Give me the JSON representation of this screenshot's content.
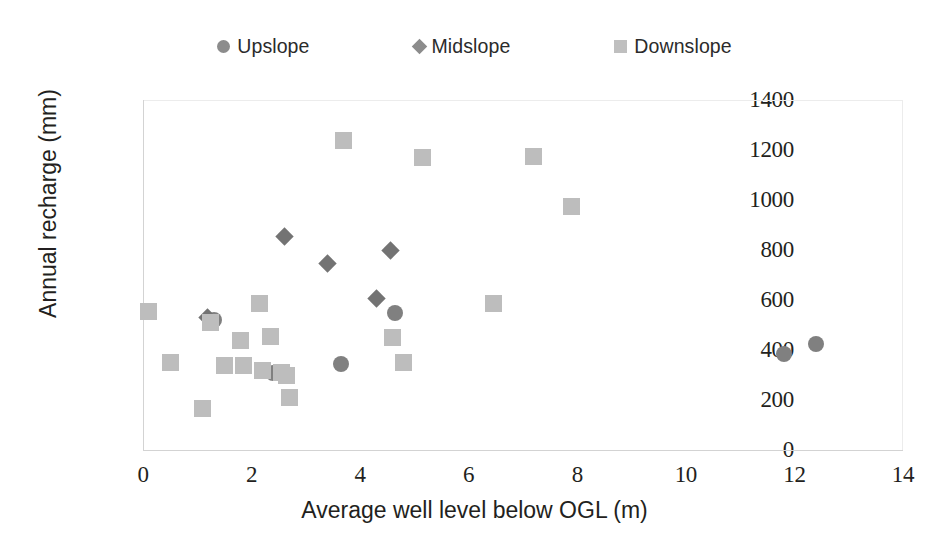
{
  "chart": {
    "title": "",
    "legend_position": "top-center"
  },
  "legend": {
    "items": [
      {
        "label": "Upslope",
        "marker": "circle",
        "color": "#808080"
      },
      {
        "label": "Midslope",
        "marker": "diamond",
        "color": "#737373"
      },
      {
        "label": "Downslope",
        "marker": "square",
        "color": "#bdbdbd"
      }
    ]
  },
  "axes": {
    "x": {
      "label": "Average well level below OGL (m)",
      "ticks": [
        "0",
        "2",
        "4",
        "6",
        "8",
        "10",
        "12",
        "14"
      ],
      "min": 0,
      "max": 14
    },
    "y": {
      "label": "Annual recharge (mm)",
      "ticks": [
        "0",
        "200",
        "400",
        "600",
        "800",
        "1000",
        "1200",
        "1400"
      ],
      "min": 0,
      "max": 1400
    }
  },
  "chart_data": {
    "type": "scatter",
    "title": "",
    "xlabel": "Average well level below OGL (m)",
    "ylabel": "Annual recharge (mm)",
    "xlim": [
      0,
      14
    ],
    "ylim": [
      0,
      1400
    ],
    "xticks": [
      0,
      2,
      4,
      6,
      8,
      10,
      12,
      14
    ],
    "yticks": [
      0,
      200,
      400,
      600,
      800,
      1000,
      1200,
      1400
    ],
    "grid": false,
    "legend": [
      "Upslope",
      "Midslope",
      "Downslope"
    ],
    "legend_position": "top-center",
    "series": [
      {
        "name": "Upslope",
        "marker": "circle",
        "color": "#808080",
        "points": [
          {
            "x": 1.3,
            "y": 520
          },
          {
            "x": 2.4,
            "y": 310
          },
          {
            "x": 3.65,
            "y": 345
          },
          {
            "x": 4.65,
            "y": 550
          },
          {
            "x": 11.8,
            "y": 385
          },
          {
            "x": 12.4,
            "y": 425
          }
        ]
      },
      {
        "name": "Midslope",
        "marker": "diamond",
        "color": "#737373",
        "points": [
          {
            "x": 1.18,
            "y": 530
          },
          {
            "x": 2.6,
            "y": 855
          },
          {
            "x": 3.4,
            "y": 745
          },
          {
            "x": 4.3,
            "y": 605
          },
          {
            "x": 4.55,
            "y": 800
          }
        ]
      },
      {
        "name": "Downslope",
        "marker": "square",
        "color": "#bdbdbd",
        "points": [
          {
            "x": 0.1,
            "y": 555
          },
          {
            "x": 0.5,
            "y": 350
          },
          {
            "x": 1.1,
            "y": 165
          },
          {
            "x": 1.25,
            "y": 510
          },
          {
            "x": 1.5,
            "y": 340
          },
          {
            "x": 1.8,
            "y": 440
          },
          {
            "x": 1.85,
            "y": 340
          },
          {
            "x": 2.15,
            "y": 585
          },
          {
            "x": 2.2,
            "y": 320
          },
          {
            "x": 2.35,
            "y": 455
          },
          {
            "x": 2.55,
            "y": 310
          },
          {
            "x": 2.65,
            "y": 300
          },
          {
            "x": 2.7,
            "y": 210
          },
          {
            "x": 3.7,
            "y": 1240
          },
          {
            "x": 4.6,
            "y": 450
          },
          {
            "x": 4.8,
            "y": 350
          },
          {
            "x": 5.15,
            "y": 1170
          },
          {
            "x": 6.45,
            "y": 588
          },
          {
            "x": 7.2,
            "y": 1175
          },
          {
            "x": 7.9,
            "y": 975
          }
        ]
      }
    ]
  }
}
